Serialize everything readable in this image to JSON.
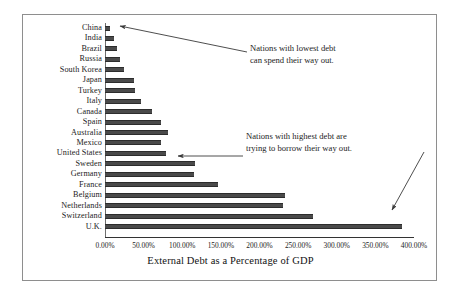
{
  "chart_data": {
    "type": "bar",
    "orientation": "horizontal",
    "title": "",
    "xlabel": "External Debt as a Percentage of GDP",
    "ylabel": "",
    "xlim": [
      0,
      400
    ],
    "grid": false,
    "legend": false,
    "x_tick_labels": [
      "0.00%",
      "50.00%",
      "100.00%",
      "150.00%",
      "200.00%",
      "250.00%",
      "300.00%",
      "350.00%",
      "400.00%"
    ],
    "x_tick_values": [
      0,
      50,
      100,
      150,
      200,
      250,
      300,
      350,
      400
    ],
    "categories": [
      "China",
      "India",
      "Brazil",
      "Russia",
      "South Korea",
      "Japan",
      "Turkey",
      "Italy",
      "Canada",
      "Spain",
      "Australia",
      "Mexico",
      "United States",
      "Sweden",
      "Germany",
      "France",
      "Belgium",
      "Netherlands",
      "Switzerland",
      "U.K."
    ],
    "values": [
      7,
      12,
      15,
      19,
      25,
      37,
      39,
      47,
      61,
      73,
      81,
      72,
      79,
      116,
      115,
      146,
      233,
      230,
      269,
      385
    ],
    "bar_color": "#4a4a4a",
    "annotations": [
      {
        "text_line1": "Nations with lowest debt",
        "text_line2": "can spend their way out.",
        "points_to": "China"
      },
      {
        "text_line1": "Nations with highest debt are",
        "text_line2": "trying to borrow their way out.",
        "points_to": "U.K."
      }
    ]
  },
  "annotations": {
    "lowest": {
      "line1": "Nations with lowest debt",
      "line2": "can spend their way out."
    },
    "highest": {
      "line1": "Nations with highest debt are",
      "line2": "trying to borrow their way out."
    }
  },
  "axis": {
    "x_title": "External Debt as a Percentage of GDP"
  }
}
